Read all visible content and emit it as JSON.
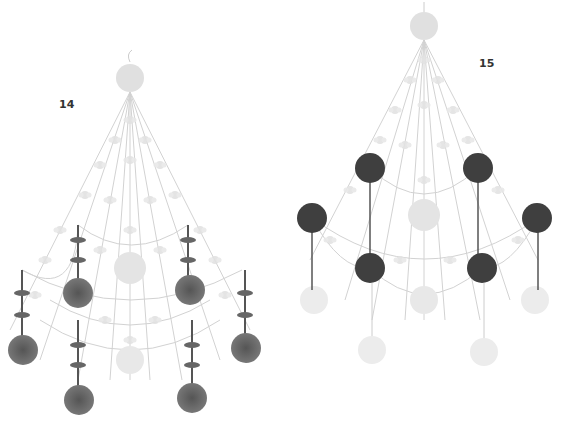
{
  "illustrations": [
    {
      "label": "14",
      "label_pos": [
        59,
        98
      ],
      "center_x": 130,
      "top_y": 78,
      "style": "dandelion-pendants",
      "dark_color": "#555555"
    },
    {
      "label": "15",
      "label_pos": [
        479,
        57
      ],
      "center_x": 424,
      "top_y": 25,
      "style": "solid-balls",
      "dark_color": "#3f3f3f"
    }
  ],
  "colors": {
    "light": "#dedede",
    "line": "#cfcfcf",
    "dark_ball": "#3f3f3f",
    "dandelion": "#5a5a5a"
  }
}
